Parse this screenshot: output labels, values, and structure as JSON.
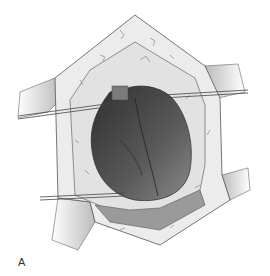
{
  "figure": {
    "panel_label": "A",
    "colors": {
      "background": "#ffffff",
      "outline": "#555555",
      "tissue": "#e6e6e6",
      "heart_dark": "#3a3a3a",
      "heart_mid": "#6a6a6a",
      "heart_light": "#8a8a8a"
    }
  }
}
